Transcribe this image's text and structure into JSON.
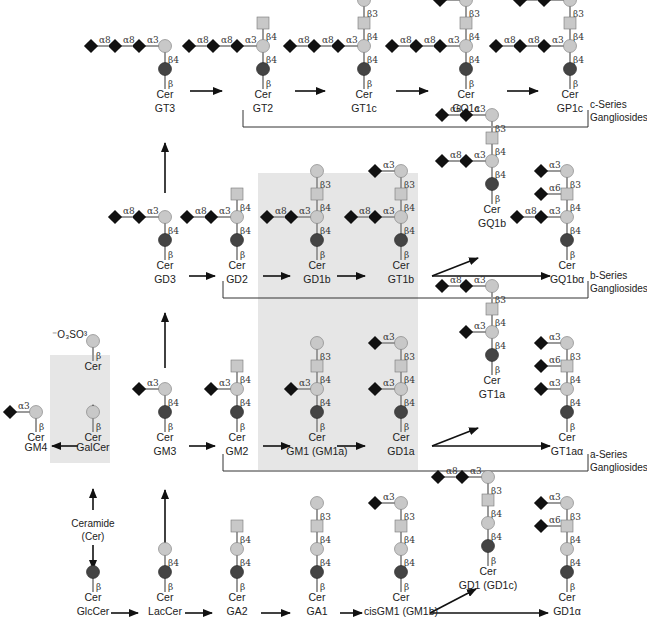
{
  "colors": {
    "sialic": "#111111",
    "gal": "#c8c8c8",
    "galnac": "#c8c8c8",
    "glc": "#444444",
    "line": "#9a9a9a",
    "arrow": "#111111",
    "highlight": "#e6e6e6",
    "bracket": "#333333"
  },
  "highlights": [
    {
      "x": 258,
      "y": 173,
      "w": 160,
      "h": 297,
      "name": "highlight-gd1b-gt1b-gm1-gd1a"
    },
    {
      "x": 50,
      "y": 355,
      "w": 60,
      "h": 108,
      "name": "highlight-galcer"
    }
  ],
  "series_labels": [
    {
      "line1": "c-Series",
      "line2": "Gangliosides",
      "x": 590,
      "y": 112
    },
    {
      "line1": "b-Series",
      "line2": "Gangliosides",
      "x": 590,
      "y": 283
    },
    {
      "line1": "a-Series",
      "line2": "Gangliosides",
      "x": 590,
      "y": 462
    }
  ],
  "brackets": [
    {
      "x1": 243,
      "y_top": 110,
      "y": 127,
      "x2": 588,
      "name": "c-series-bracket"
    },
    {
      "x1": 223,
      "y_top": 281,
      "y": 298,
      "x2": 588,
      "name": "b-series-bracket"
    },
    {
      "x1": 223,
      "y_top": 454,
      "y": 471,
      "x2": 588,
      "name": "a-series-bracket"
    }
  ],
  "ceramide_label": {
    "line1": "Ceramide",
    "line2": "(Cer)",
    "x": 93,
    "y": 527
  },
  "sulfate_label": "⁻O₃SO³",
  "molecules": [
    {
      "id": "GT3",
      "name": "GT3",
      "x": 165,
      "y": 110,
      "stem": [
        "glc",
        "gal"
      ],
      "branches": [
        {
          "at": 1,
          "chain": [
            "sia:α3",
            "sia:α8",
            "sia:α8"
          ]
        }
      ]
    },
    {
      "id": "GT2",
      "name": "GT2",
      "x": 263,
      "y": 110,
      "stem": [
        "glc",
        "gal",
        "galnac"
      ],
      "branches": [
        {
          "at": 1,
          "chain": [
            "sia:α3",
            "sia:α8",
            "sia:α8"
          ]
        }
      ]
    },
    {
      "id": "GT1c",
      "name": "GT1c",
      "x": 364,
      "y": 110,
      "stem": [
        "glc",
        "gal",
        "galnac",
        "gal"
      ],
      "branches": [
        {
          "at": 1,
          "chain": [
            "sia:α3",
            "sia:α8",
            "sia:α8"
          ]
        }
      ]
    },
    {
      "id": "GQ1c",
      "name": "GQ1c",
      "x": 466,
      "y": 110,
      "stem": [
        "glc",
        "gal",
        "galnac",
        "gal"
      ],
      "branches": [
        {
          "at": 1,
          "chain": [
            "sia:α3",
            "sia:α8",
            "sia:α8"
          ]
        },
        {
          "at": 3,
          "chain": [
            "sia:α3"
          ]
        }
      ]
    },
    {
      "id": "GP1c",
      "name": "GP1c",
      "x": 570,
      "y": 110,
      "stem": [
        "glc",
        "gal",
        "galnac",
        "gal"
      ],
      "branches": [
        {
          "at": 1,
          "chain": [
            "sia:α3",
            "sia:α8",
            "sia:α8"
          ]
        },
        {
          "at": 3,
          "chain": [
            "sia:α3",
            "sia:α8"
          ]
        }
      ]
    },
    {
      "id": "GD3",
      "name": "GD3",
      "x": 165,
      "y": 281,
      "stem": [
        "glc",
        "gal"
      ],
      "branches": [
        {
          "at": 1,
          "chain": [
            "sia:α3",
            "sia:α8"
          ]
        }
      ]
    },
    {
      "id": "GD2",
      "name": "GD2",
      "x": 237,
      "y": 281,
      "stem": [
        "glc",
        "gal",
        "galnac"
      ],
      "branches": [
        {
          "at": 1,
          "chain": [
            "sia:α3",
            "sia:α8"
          ]
        }
      ]
    },
    {
      "id": "GD1b",
      "name": "GD1b",
      "x": 317,
      "y": 281,
      "stem": [
        "glc",
        "gal",
        "galnac",
        "gal"
      ],
      "branches": [
        {
          "at": 1,
          "chain": [
            "sia:α3",
            "sia:α8"
          ]
        }
      ]
    },
    {
      "id": "GT1b",
      "name": "GT1b",
      "x": 401,
      "y": 281,
      "stem": [
        "glc",
        "gal",
        "galnac",
        "gal"
      ],
      "branches": [
        {
          "at": 1,
          "chain": [
            "sia:α3",
            "sia:α8"
          ]
        },
        {
          "at": 3,
          "chain": [
            "sia:α3"
          ]
        }
      ]
    },
    {
      "id": "GQ1b",
      "name": "GQ1b",
      "x": 492,
      "y": 225,
      "stem": [
        "glc",
        "gal",
        "galnac",
        "gal"
      ],
      "branches": [
        {
          "at": 1,
          "chain": [
            "sia:α3",
            "sia:α8"
          ]
        },
        {
          "at": 3,
          "chain": [
            "sia:α3",
            "sia:α8"
          ]
        }
      ]
    },
    {
      "id": "GQ1ba",
      "name": "GQ1bα",
      "x": 567,
      "y": 281,
      "stem": [
        "glc",
        "gal",
        "galnac",
        "gal"
      ],
      "branches": [
        {
          "at": 1,
          "chain": [
            "sia:α3",
            "sia:α8"
          ]
        },
        {
          "at": 2,
          "chain": [
            "sia:α6"
          ]
        },
        {
          "at": 3,
          "chain": [
            "sia:α3"
          ]
        }
      ]
    },
    {
      "id": "GM4",
      "name": "GM4",
      "x": 36,
      "y": 453,
      "stem": [
        "gal"
      ],
      "branches": [
        {
          "at": 0,
          "chain": [
            "sia:α3"
          ]
        }
      ],
      "name_dy": -4
    },
    {
      "id": "GalCer",
      "name": "GalCer",
      "x": 93,
      "y": 453,
      "stem": [
        "gal"
      ],
      "branches": [],
      "name_dy": -4
    },
    {
      "id": "SulfGalCer",
      "name": "",
      "x": 93,
      "y": 382,
      "stem": [
        "gal"
      ],
      "branches": [],
      "sulfate": true
    },
    {
      "id": "GM3",
      "name": "GM3",
      "x": 165,
      "y": 453,
      "stem": [
        "glc",
        "gal"
      ],
      "branches": [
        {
          "at": 1,
          "chain": [
            "sia:α3"
          ]
        }
      ]
    },
    {
      "id": "GM2",
      "name": "GM2",
      "x": 237,
      "y": 453,
      "stem": [
        "glc",
        "gal",
        "galnac"
      ],
      "branches": [
        {
          "at": 1,
          "chain": [
            "sia:α3"
          ]
        }
      ]
    },
    {
      "id": "GM1",
      "name": "GM1 (GM1a)",
      "x": 317,
      "y": 453,
      "stem": [
        "glc",
        "gal",
        "galnac",
        "gal"
      ],
      "branches": [
        {
          "at": 1,
          "chain": [
            "sia:α3"
          ]
        }
      ]
    },
    {
      "id": "GD1a",
      "name": "GD1a",
      "x": 401,
      "y": 453,
      "stem": [
        "glc",
        "gal",
        "galnac",
        "gal"
      ],
      "branches": [
        {
          "at": 1,
          "chain": [
            "sia:α3"
          ]
        },
        {
          "at": 3,
          "chain": [
            "sia:α3"
          ]
        }
      ]
    },
    {
      "id": "GT1a",
      "name": "GT1a",
      "x": 492,
      "y": 396,
      "stem": [
        "glc",
        "gal",
        "galnac",
        "gal"
      ],
      "branches": [
        {
          "at": 1,
          "chain": [
            "sia:α3"
          ]
        },
        {
          "at": 3,
          "chain": [
            "sia:α3",
            "sia:α8"
          ]
        }
      ]
    },
    {
      "id": "GT1aa",
      "name": "GT1aα",
      "x": 567,
      "y": 453,
      "stem": [
        "glc",
        "gal",
        "galnac",
        "gal"
      ],
      "branches": [
        {
          "at": 1,
          "chain": [
            "sia:α3"
          ]
        },
        {
          "at": 2,
          "chain": [
            "sia:α6"
          ]
        },
        {
          "at": 3,
          "chain": [
            "sia:α3"
          ]
        }
      ]
    },
    {
      "id": "GlcCer",
      "name": "GlcCer",
      "x": 93,
      "y": 613,
      "stem": [
        "glc"
      ],
      "branches": []
    },
    {
      "id": "LacCer",
      "name": "LacCer",
      "x": 165,
      "y": 613,
      "stem": [
        "glc",
        "gal"
      ],
      "branches": []
    },
    {
      "id": "GA2",
      "name": "GA2",
      "x": 237,
      "y": 613,
      "stem": [
        "glc",
        "gal",
        "galnac"
      ],
      "branches": []
    },
    {
      "id": "GA1",
      "name": "GA1",
      "x": 317,
      "y": 613,
      "stem": [
        "glc",
        "gal",
        "galnac",
        "gal"
      ],
      "branches": []
    },
    {
      "id": "cisGM1",
      "name": "cisGM1 (GM1b)",
      "x": 401,
      "y": 613,
      "stem": [
        "glc",
        "gal",
        "galnac",
        "gal"
      ],
      "branches": [
        {
          "at": 3,
          "chain": [
            "sia:α3"
          ]
        }
      ]
    },
    {
      "id": "GD1c",
      "name": "GD1 (GD1c)",
      "x": 488,
      "y": 587,
      "stem": [
        "glc",
        "gal",
        "galnac",
        "gal"
      ],
      "branches": [
        {
          "at": 3,
          "chain": [
            "sia:α3",
            "sia:α8"
          ]
        }
      ],
      "name_dy": 0
    },
    {
      "id": "GD1alpha",
      "name": "GD1α",
      "x": 567,
      "y": 613,
      "stem": [
        "glc",
        "gal",
        "galnac",
        "gal"
      ],
      "branches": [
        {
          "at": 2,
          "chain": [
            "sia:α6"
          ]
        },
        {
          "at": 3,
          "chain": [
            "sia:α3"
          ]
        }
      ]
    }
  ],
  "arrows": [
    {
      "x1": 190,
      "y1": 91,
      "x2": 222,
      "y2": 91
    },
    {
      "x1": 295,
      "y1": 91,
      "x2": 325,
      "y2": 91
    },
    {
      "x1": 396,
      "y1": 91,
      "x2": 428,
      "y2": 91
    },
    {
      "x1": 507,
      "y1": 91,
      "x2": 538,
      "y2": 91
    },
    {
      "x1": 165,
      "y1": 193,
      "x2": 165,
      "y2": 143
    },
    {
      "x1": 189,
      "y1": 276,
      "x2": 215,
      "y2": 276
    },
    {
      "x1": 263,
      "y1": 276,
      "x2": 290,
      "y2": 276
    },
    {
      "x1": 337,
      "y1": 276,
      "x2": 365,
      "y2": 276
    },
    {
      "x1": 432,
      "y1": 276,
      "x2": 478,
      "y2": 258
    },
    {
      "x1": 432,
      "y1": 276,
      "x2": 550,
      "y2": 276
    },
    {
      "x1": 165,
      "y1": 368,
      "x2": 165,
      "y2": 313
    },
    {
      "x1": 93,
      "y1": 427,
      "x2": 93,
      "y2": 405
    },
    {
      "x1": 78,
      "y1": 446,
      "x2": 52,
      "y2": 446
    },
    {
      "x1": 189,
      "y1": 446,
      "x2": 215,
      "y2": 446
    },
    {
      "x1": 263,
      "y1": 446,
      "x2": 290,
      "y2": 446
    },
    {
      "x1": 337,
      "y1": 446,
      "x2": 365,
      "y2": 446
    },
    {
      "x1": 432,
      "y1": 446,
      "x2": 478,
      "y2": 428
    },
    {
      "x1": 432,
      "y1": 446,
      "x2": 550,
      "y2": 446
    },
    {
      "x1": 93,
      "y1": 510,
      "x2": 93,
      "y2": 489
    },
    {
      "x1": 93,
      "y1": 545,
      "x2": 93,
      "y2": 569
    },
    {
      "x1": 165,
      "y1": 547,
      "x2": 165,
      "y2": 490
    },
    {
      "x1": 111,
      "y1": 613,
      "x2": 138,
      "y2": 613
    },
    {
      "x1": 185,
      "y1": 613,
      "x2": 212,
      "y2": 613
    },
    {
      "x1": 261,
      "y1": 613,
      "x2": 290,
      "y2": 613
    },
    {
      "x1": 340,
      "y1": 613,
      "x2": 362,
      "y2": 613
    },
    {
      "x1": 430,
      "y1": 613,
      "x2": 476,
      "y2": 589
    },
    {
      "x1": 430,
      "y1": 613,
      "x2": 548,
      "y2": 613
    }
  ],
  "stem_links": {
    "glc": "β",
    "gal_after_glc": "β4",
    "galnac": "β4",
    "gal_after_galnac": "β3"
  },
  "cer_label": "Cer"
}
